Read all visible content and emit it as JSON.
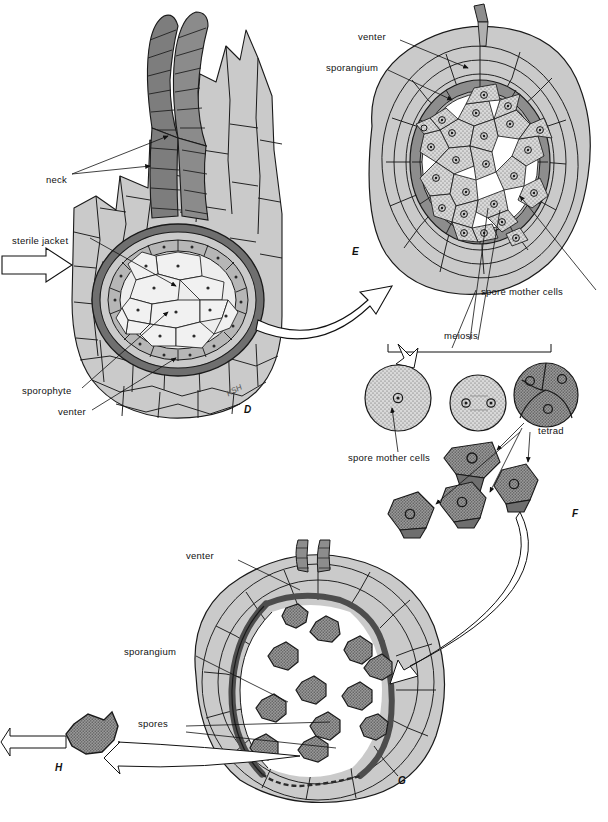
{
  "figure": {
    "artist_signature": "KSH",
    "palette": {
      "tissue_light": "#cacaca",
      "tissue_mid": "#a8a8a8",
      "tissue_dark": "#7d7d7d",
      "wall_line": "#1a1a1a",
      "sporangium_ring": "#8d8d8d",
      "spore_fill": "#8f8f8f",
      "inner_light": "#e3e3e3",
      "white": "#ffffff",
      "label_text": "#111111"
    }
  },
  "plates": {
    "d": {
      "id": "D",
      "x": 244,
      "y": 404
    },
    "e": {
      "id": "E",
      "x": 352,
      "y": 246
    },
    "f": {
      "id": "F",
      "x": 572,
      "y": 508
    },
    "g": {
      "id": "G",
      "x": 398,
      "y": 782
    },
    "h": {
      "id": "H",
      "x": 55,
      "y": 762
    }
  },
  "labels": {
    "panel_d": [
      {
        "key": "neck",
        "text": "neck",
        "x": 46,
        "y": 174
      },
      {
        "key": "sterile_jacket",
        "text": "sterile jacket",
        "x": 12,
        "y": 235
      },
      {
        "key": "sporophyte",
        "text": "sporophyte",
        "x": 22,
        "y": 385
      },
      {
        "key": "venter",
        "text": "venter",
        "x": 58,
        "y": 406
      }
    ],
    "panel_e": [
      {
        "key": "venter",
        "text": "venter",
        "x": 358,
        "y": 37
      },
      {
        "key": "sporangium",
        "text": "sporangium",
        "x": 326,
        "y": 68
      },
      {
        "key": "spore_mother_cells",
        "text": "spore mother cells",
        "x": 481,
        "y": 292
      }
    ],
    "panel_f": [
      {
        "key": "meiosis",
        "text": "meiosis",
        "x": 444,
        "y": 336
      },
      {
        "key": "spore_mother_cells",
        "text": "spore mother cells",
        "x": 368,
        "y": 458
      },
      {
        "key": "tetrad",
        "text": "tetrad",
        "x": 540,
        "y": 431
      }
    ],
    "panel_g": [
      {
        "key": "venter",
        "text": "venter",
        "x": 186,
        "y": 556
      },
      {
        "key": "sporangium",
        "text": "sporangium",
        "x": 124,
        "y": 652
      },
      {
        "key": "spores",
        "text": "spores",
        "x": 138,
        "y": 724
      }
    ]
  },
  "structures": {
    "panel_d": {
      "name": "archegonium with young sporophyte (longitudinal section)",
      "parts": [
        "neck",
        "sterile jacket",
        "venter",
        "sporophyte"
      ],
      "neck_canal_count": 2
    },
    "panel_e": {
      "name": "sporangium cross section with spore mother cells",
      "parts": [
        "venter",
        "sporangium",
        "spore mother cells"
      ],
      "spore_mother_cell_count": 24
    },
    "panel_f": {
      "name": "meiosis sequence producing a spore tetrad",
      "stages": [
        "spore mother cell (1 nucleus)",
        "2 nuclei",
        "tetrad (4 nuclei)"
      ],
      "free_spore_count": 4
    },
    "panel_g": {
      "name": "mature sporangium releasing spores",
      "parts": [
        "venter",
        "sporangium",
        "spores"
      ],
      "spore_count": 12
    },
    "panel_h": {
      "name": "released single spore",
      "spore_count": 1
    }
  }
}
